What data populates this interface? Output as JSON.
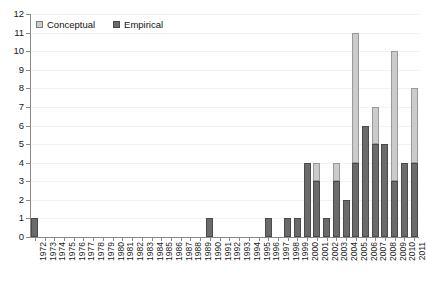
{
  "chart_data": {
    "type": "bar",
    "stacked": true,
    "title": "",
    "subtitle": "",
    "xlabel": "",
    "ylabel": "",
    "ylim": [
      0,
      12
    ],
    "ytick_step": 1,
    "yticks": [
      "0",
      "1",
      "2",
      "3",
      "4",
      "5",
      "6",
      "7",
      "8",
      "9",
      "10",
      "11",
      "12"
    ],
    "grid": true,
    "grid_axis": "y",
    "legend_position": "top-left",
    "categories": [
      "1972",
      "1973",
      "1974",
      "1975",
      "1976",
      "1977",
      "1978",
      "1979",
      "1980",
      "1981",
      "1982",
      "1983",
      "1984",
      "1985",
      "1986",
      "1987",
      "1988",
      "1989",
      "1990",
      "1991",
      "1992",
      "1993",
      "1994",
      "1995",
      "1996",
      "1997",
      "1998",
      "1999",
      "2000",
      "2001",
      "2002",
      "2003",
      "2004",
      "2005",
      "2006",
      "2007",
      "2008",
      "2009",
      "2010",
      "2011"
    ],
    "series": [
      {
        "name": "Empirical",
        "color": "#6b6b6b",
        "values": [
          1,
          0,
          0,
          0,
          0,
          0,
          0,
          0,
          0,
          0,
          0,
          0,
          0,
          0,
          0,
          0,
          0,
          0,
          1,
          0,
          0,
          0,
          0,
          0,
          1,
          0,
          1,
          1,
          4,
          3,
          1,
          3,
          2,
          4,
          6,
          5,
          5,
          3,
          4,
          4
        ]
      },
      {
        "name": "Conceptual",
        "color": "#cbcbcb",
        "values": [
          0,
          0,
          0,
          0,
          0,
          0,
          0,
          0,
          0,
          0,
          0,
          0,
          0,
          0,
          0,
          0,
          0,
          0,
          0,
          0,
          0,
          0,
          0,
          0,
          0,
          0,
          0,
          0,
          0,
          1,
          0,
          1,
          0,
          7,
          0,
          2,
          0,
          7,
          0,
          4
        ]
      }
    ],
    "totals": [
      1,
      0,
      0,
      0,
      0,
      0,
      0,
      0,
      0,
      0,
      0,
      0,
      0,
      0,
      0,
      0,
      0,
      0,
      1,
      0,
      0,
      0,
      0,
      0,
      1,
      0,
      1,
      1,
      4,
      4,
      1,
      4,
      2,
      11,
      6,
      7,
      5,
      10,
      4,
      8
    ]
  },
  "legend": {
    "items": [
      {
        "label": "Conceptual",
        "swatch": "conceptual"
      },
      {
        "label": "Empirical",
        "swatch": "empirical"
      }
    ]
  }
}
